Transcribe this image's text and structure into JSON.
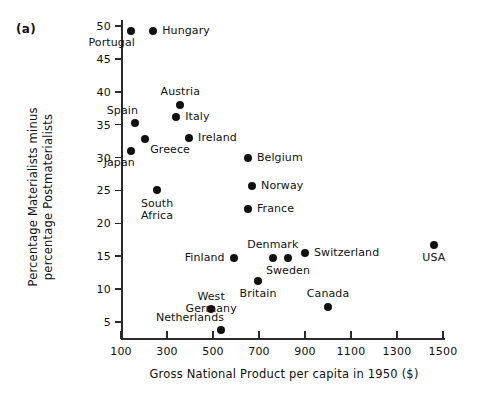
{
  "figure": {
    "panel_tag": "(a)"
  },
  "chart_data": {
    "type": "scatter",
    "title": "",
    "xlabel": "Gross National Product per capita in 1950 ($)",
    "ylabel": "Percentage Materialists minus percentage Postmaterialists",
    "ylabel_line1": "Percentage Materialists minus",
    "ylabel_line2": "percentage Postmaterialists",
    "xlim": [
      100,
      1500
    ],
    "ylim": [
      3,
      51
    ],
    "xticks": [
      100,
      300,
      500,
      700,
      900,
      1100,
      1300,
      1500
    ],
    "xtick_labels": [
      "100",
      "300",
      "500",
      "700",
      "900",
      "1100",
      "1300",
      "1500"
    ],
    "yticks": [
      5,
      10,
      15,
      20,
      25,
      30,
      35,
      40,
      45,
      50
    ],
    "ytick_labels": [
      "5",
      "10",
      "15",
      "20",
      "25",
      "30",
      "35",
      "40",
      "45",
      "50"
    ],
    "grid": false,
    "legend": "none",
    "marker_color": "#111111",
    "points": [
      {
        "label": "Portugal",
        "x": 143,
        "y": 49.3,
        "label_pos": "below-left"
      },
      {
        "label": "Hungary",
        "x": 240,
        "y": 49.2,
        "label_pos": "right"
      },
      {
        "label": "Austria",
        "x": 358,
        "y": 38.0,
        "label_pos": "above"
      },
      {
        "label": "Spain",
        "x": 161,
        "y": 35.2,
        "label_pos": "above-left"
      },
      {
        "label": "Italy",
        "x": 340,
        "y": 36.1,
        "label_pos": "right"
      },
      {
        "label": "Greece",
        "x": 205,
        "y": 32.8,
        "label_pos": "below-right"
      },
      {
        "label": "Ireland",
        "x": 396,
        "y": 32.9,
        "label_pos": "right"
      },
      {
        "label": "Japan",
        "x": 143,
        "y": 31.0,
        "label_pos": "below-left"
      },
      {
        "label": "Belgium",
        "x": 652,
        "y": 30.0,
        "label_pos": "right"
      },
      {
        "label": "South Africa",
        "x": 257,
        "y": 25.1,
        "label_pos": "below"
      },
      {
        "label": "Norway",
        "x": 670,
        "y": 25.6,
        "label_pos": "right"
      },
      {
        "label": "France",
        "x": 652,
        "y": 22.2,
        "label_pos": "right"
      },
      {
        "label": "Finland",
        "x": 590,
        "y": 14.7,
        "label_pos": "left"
      },
      {
        "label": "Denmark",
        "x": 760,
        "y": 14.7,
        "label_pos": "above"
      },
      {
        "label": "Sweden",
        "x": 826,
        "y": 14.7,
        "label_pos": "below"
      },
      {
        "label": "Switzerland",
        "x": 900,
        "y": 15.5,
        "label_pos": "right"
      },
      {
        "label": "USA",
        "x": 1460,
        "y": 16.7,
        "label_pos": "below"
      },
      {
        "label": "Britain",
        "x": 696,
        "y": 11.2,
        "label_pos": "below"
      },
      {
        "label": "West Germany",
        "x": 492,
        "y": 7.0,
        "label_pos": "above"
      },
      {
        "label": "Canada",
        "x": 1000,
        "y": 7.3,
        "label_pos": "above"
      },
      {
        "label": "Netherlands",
        "x": 535,
        "y": 3.8,
        "label_pos": "above-left"
      }
    ]
  }
}
